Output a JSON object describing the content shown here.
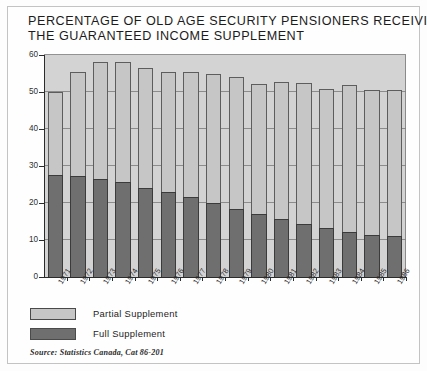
{
  "chart_data": {
    "type": "bar",
    "title": "PERCENTAGE OF OLD AGE SECURITY PENSIONERS RECEIVING THE GUARANTEED INCOME SUPPLEMENT",
    "title_line1": "PERCENTAGE OF OLD AGE SECURITY PENSIONERS RECEIVING",
    "title_line2": "THE GUARANTEED INCOME SUPPLEMENT",
    "xlabel": "",
    "ylabel": "",
    "ylim": [
      0,
      60
    ],
    "yticks": [
      0,
      10,
      20,
      30,
      40,
      50,
      60
    ],
    "ytick_labels": [
      "0",
      "10",
      "20",
      "30",
      "40",
      "50",
      "60"
    ],
    "grid": true,
    "stacked": true,
    "legend_position": "below-left",
    "categories": [
      "1971",
      "1972",
      "1973",
      "1974",
      "1975",
      "1976",
      "1977",
      "1978",
      "1979",
      "1980",
      "1981",
      "1982",
      "1983",
      "1984",
      "1985",
      "1986"
    ],
    "series": [
      {
        "name": "Full Supplement",
        "color": "#6f6f6f",
        "values": [
          27.5,
          27.3,
          26.6,
          25.6,
          24.0,
          23.0,
          21.5,
          20.0,
          18.5,
          17.0,
          15.6,
          14.4,
          13.2,
          12.2,
          11.3,
          11.0
        ]
      },
      {
        "name": "Partial Supplement",
        "color": "#c6c6c6",
        "values": [
          22.5,
          28.2,
          31.4,
          32.4,
          32.5,
          32.5,
          34.0,
          34.8,
          35.5,
          35.2,
          37.0,
          38.1,
          37.5,
          39.6,
          39.2,
          39.5
        ]
      }
    ],
    "totals": [
      50.0,
      55.5,
      58.0,
      58.0,
      56.5,
      55.5,
      55.5,
      54.8,
      54.0,
      52.2,
      52.6,
      52.5,
      50.7,
      51.8,
      50.5,
      50.5
    ],
    "source": "Source: Statistics Canada, Cat 86-201"
  },
  "legend": {
    "items": [
      {
        "label": "Partial Supplement",
        "color": "#c6c6c6"
      },
      {
        "label": "Full Supplement",
        "color": "#6f6f6f"
      }
    ]
  }
}
